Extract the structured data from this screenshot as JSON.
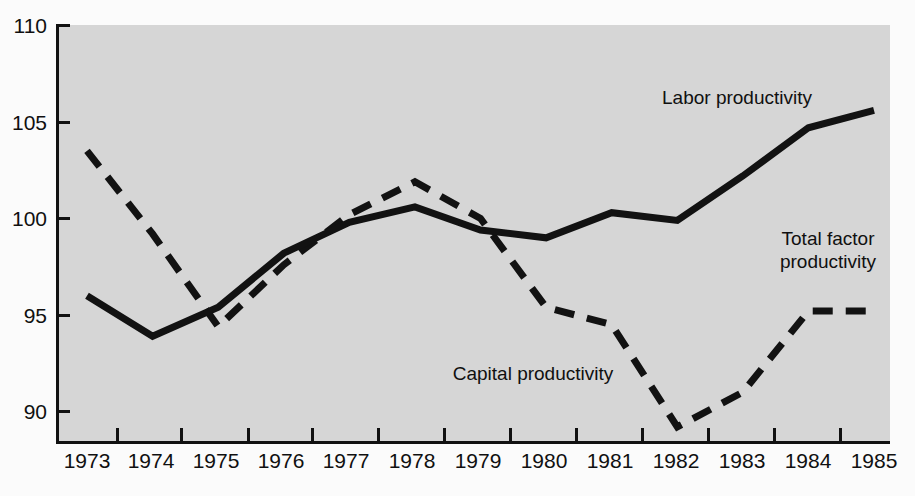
{
  "chart_data": {
    "type": "line",
    "title": "",
    "subtitle": "",
    "xlabel": "",
    "ylabel": "",
    "xlim": [
      1973,
      1985
    ],
    "ylim": [
      88.5,
      110
    ],
    "yticks": [
      90,
      95,
      100,
      105,
      110
    ],
    "ytick_labels": [
      "90",
      "95",
      "100",
      "105",
      "110"
    ],
    "grid": false,
    "legend_position": "inline-annotations",
    "categories": [
      1973,
      1974,
      1975,
      1976,
      1977,
      1978,
      1979,
      1980,
      1981,
      1982,
      1983,
      1984,
      1985
    ],
    "xtick_labels": [
      "1973",
      "1974",
      "1975",
      "1976",
      "1977",
      "1978",
      "1979",
      "1980",
      "1981",
      "1982",
      "1983",
      "1984",
      "1985"
    ],
    "series": [
      {
        "name": "Labor productivity",
        "style": "solid",
        "color": "#121212",
        "values": [
          96.0,
          93.9,
          95.4,
          98.2,
          99.8,
          100.6,
          99.4,
          99.0,
          100.3,
          99.9,
          102.2,
          104.7,
          105.6
        ]
      },
      {
        "name": "Capital productivity",
        "style": "dashed",
        "color": "#121212",
        "values": [
          103.5,
          99.2,
          94.4,
          97.6,
          100.2,
          101.9,
          100.0,
          95.4,
          94.5,
          89.2,
          91.0,
          95.2,
          95.2
        ]
      }
    ],
    "annotations": [
      {
        "text": "Labor productivity",
        "x": 1981.1,
        "y": 106.1,
        "align": "center",
        "lines": [
          "Labor productivity"
        ]
      },
      {
        "text": "Capital productivity",
        "x": 1979.1,
        "y": 92.0,
        "align": "center",
        "lines": [
          "Capital productivity"
        ]
      },
      {
        "text": "Total factor productivity",
        "x": 1984.3,
        "y": 102.0,
        "align": "center",
        "lines": [
          "Total factor",
          "productivity"
        ]
      }
    ],
    "colors": {
      "plot_background": "#d6d6d6",
      "page_background": "#fbfbfb",
      "axis": "#111111",
      "line": "#121212",
      "text": "#101010"
    }
  },
  "labels": {
    "y": {
      "t110": "110",
      "t105": "105",
      "t100": "100",
      "t95": "95",
      "t90": "90"
    },
    "x": {
      "y1973": "1973",
      "y1974": "1974",
      "y1975": "1975",
      "y1976": "1976",
      "y1977": "1977",
      "y1978": "1978",
      "y1979": "1979",
      "y1980": "1980",
      "y1981": "1981",
      "y1982": "1982",
      "y1983": "1983",
      "y1984": "1984",
      "y1985": "1985"
    },
    "series": {
      "labor": "Labor productivity",
      "capital": "Capital productivity",
      "total_line1": "Total factor",
      "total_line2": "productivity"
    }
  }
}
